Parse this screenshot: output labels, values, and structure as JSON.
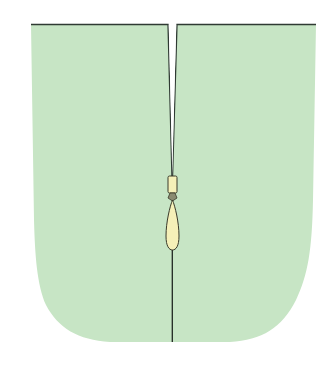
{
  "diagram": {
    "colors": {
      "background": "#ffffff",
      "fabric": "#c7e5c5",
      "outline": "#2f3a33",
      "zipper_pull": "#f5f0b8",
      "zipper_pull_outline": "#3a3a2a"
    },
    "parts": [
      {
        "name": "left-panel"
      },
      {
        "name": "right-panel"
      },
      {
        "name": "zipper-slider"
      },
      {
        "name": "zipper-pull-tab"
      },
      {
        "name": "center-seam"
      }
    ]
  }
}
